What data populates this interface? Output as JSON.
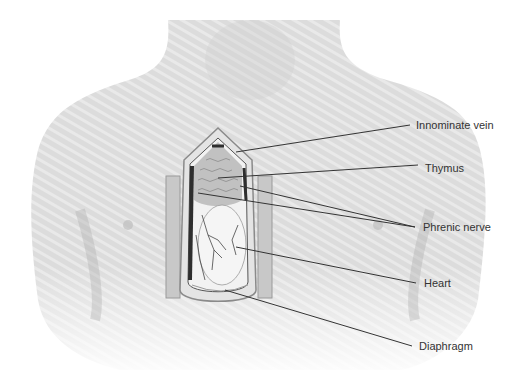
{
  "figure": {
    "labels": [
      {
        "id": "innominate-vein",
        "text": "Innominate vein"
      },
      {
        "id": "thymus",
        "text": "Thymus"
      },
      {
        "id": "phrenic-nerve",
        "text": "Phrenic nerve"
      },
      {
        "id": "heart",
        "text": "Heart"
      },
      {
        "id": "diaphragm",
        "text": "Diaphragm"
      }
    ]
  },
  "colors": {
    "skin": "#d9d9d9",
    "skin_shadow": "#bdbdbd",
    "leader_line": "#333333",
    "label_text": "#333333",
    "cavity_dark": "#3a3a3a"
  }
}
